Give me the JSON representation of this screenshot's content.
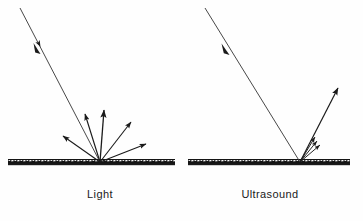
{
  "figure": {
    "background_color": "#fefefe",
    "ink_color": "#1a1a1a",
    "width": 363,
    "height": 221
  },
  "panels": [
    {
      "id": "light",
      "label": "Light",
      "label_x": 100,
      "label_y": 188,
      "reflection_type": "diffuse",
      "surface": {
        "x_start": 8,
        "x_end": 175,
        "y": 163,
        "thickness": 4,
        "texture": "rough"
      },
      "incident_ray": {
        "x1": 20,
        "y1": 8,
        "x2": 100,
        "y2": 162,
        "arrow_position": 0.27,
        "direction": "toward-surface"
      },
      "impact_point": {
        "x": 100,
        "y": 162
      },
      "reflected_rays": [
        {
          "x2": 63,
          "y2": 136,
          "angle_deg": 149
        },
        {
          "x2": 85,
          "y2": 114,
          "angle_deg": 107
        },
        {
          "x2": 104,
          "y2": 110,
          "angle_deg": 86
        },
        {
          "x2": 131,
          "y2": 122,
          "angle_deg": 52
        },
        {
          "x2": 146,
          "y2": 144,
          "angle_deg": 23
        }
      ]
    },
    {
      "id": "ultrasound",
      "label": "Ultrasound",
      "label_x": 270,
      "label_y": 188,
      "reflection_type": "specular",
      "surface": {
        "x_start": 188,
        "x_end": 350,
        "y": 163,
        "thickness": 4,
        "texture": "rough"
      },
      "incident_ray": {
        "x1": 205,
        "y1": 8,
        "x2": 300,
        "y2": 162,
        "arrow_position": 0.3,
        "direction": "toward-surface"
      },
      "impact_point": {
        "x": 300,
        "y": 162
      },
      "reflected_rays": [
        {
          "x2": 338,
          "y2": 88,
          "angle_deg": 63
        },
        {
          "x2": 315,
          "y2": 137,
          "angle_deg": 59
        },
        {
          "x2": 317,
          "y2": 141,
          "angle_deg": 55
        },
        {
          "x2": 320,
          "y2": 145,
          "angle_deg": 50
        }
      ]
    }
  ]
}
